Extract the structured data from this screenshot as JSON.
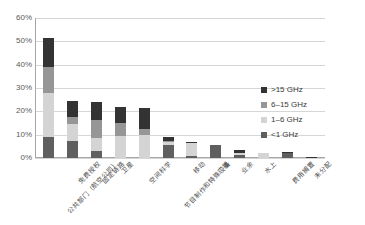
{
  "chart_data": {
    "type": "bar",
    "title": "",
    "subtitle": "",
    "xlabel": "",
    "ylabel": "",
    "ylim": [
      0,
      60
    ],
    "ytick_labels": [
      "0%",
      "10%",
      "20%",
      "30%",
      "40%",
      "50%",
      "60%"
    ],
    "ytick_values": [
      0,
      10,
      20,
      30,
      40,
      50,
      60
    ],
    "grid": true,
    "stacked": true,
    "legend_position": "right",
    "categories": [
      "公共部门（航空公司）",
      "免费授权",
      "固定链路",
      "卫星",
      "空间科学",
      "节目制作和特殊设备",
      "移动",
      "广播",
      "业余",
      "水上",
      "费用搁置",
      "未分配"
    ],
    "series": [
      {
        "name": "<1 GHz",
        "color": "#5f5f5f",
        "values": [
          9.0,
          7.5,
          3.0,
          0.0,
          0.0,
          5.5,
          1.0,
          5.5,
          1.5,
          0.0,
          2.0,
          0.0
        ]
      },
      {
        "name": "1–6 GHz",
        "color": "#d4d4d4",
        "values": [
          19.0,
          7.0,
          5.5,
          9.5,
          10.0,
          1.5,
          5.5,
          0.0,
          0.5,
          2.0,
          0.0,
          0.0
        ]
      },
      {
        "name": "6–15 GHz",
        "color": "#969696",
        "values": [
          11.0,
          3.0,
          8.0,
          5.5,
          2.5,
          0.5,
          0.0,
          0.0,
          0.0,
          0.0,
          0.0,
          0.0
        ]
      },
      {
        "name": ">15 GHz",
        "color": "#333333",
        "values": [
          12.5,
          7.0,
          7.5,
          7.0,
          9.0,
          1.5,
          0.5,
          0.0,
          1.5,
          0.0,
          0.5,
          0.5
        ]
      }
    ]
  },
  "legend": {
    "items": [
      {
        "label": ">15 GHz",
        "color": "#333333"
      },
      {
        "label": "6–15 GHz",
        "color": "#969696"
      },
      {
        "label": "1–6 GHz",
        "color": "#d4d4d4"
      },
      {
        "label": "<1 GHz",
        "color": "#5f5f5f"
      }
    ]
  }
}
